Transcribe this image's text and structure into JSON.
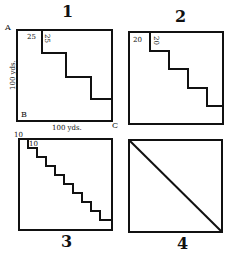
{
  "figures": [
    {
      "number": "1",
      "corner_labels": {
        "a": "A",
        "b": "B",
        "c": "C"
      },
      "side_label_vertical": "100 yds.",
      "side_label_horizontal": "100 yds.",
      "step_width_label": "25",
      "step_height_label": "25",
      "steps": 4,
      "box": {
        "x": 17,
        "y": 30,
        "w": 95,
        "h": 91
      }
    },
    {
      "number": "2",
      "step_width_label": "20",
      "step_height_label": "20",
      "steps": 5,
      "box": {
        "x": 129,
        "y": 32,
        "w": 94,
        "h": 92
      }
    },
    {
      "number": "3",
      "step_width_label": "10",
      "step_height_label": "10",
      "steps": 10,
      "box": {
        "x": 19,
        "y": 139,
        "w": 93,
        "h": 91
      }
    },
    {
      "number": "4",
      "steps": 0,
      "diagonal": true,
      "box": {
        "x": 129,
        "y": 140,
        "w": 93,
        "h": 92
      }
    }
  ],
  "colors": {
    "ink": "#111111",
    "paper": "#ffffff"
  }
}
